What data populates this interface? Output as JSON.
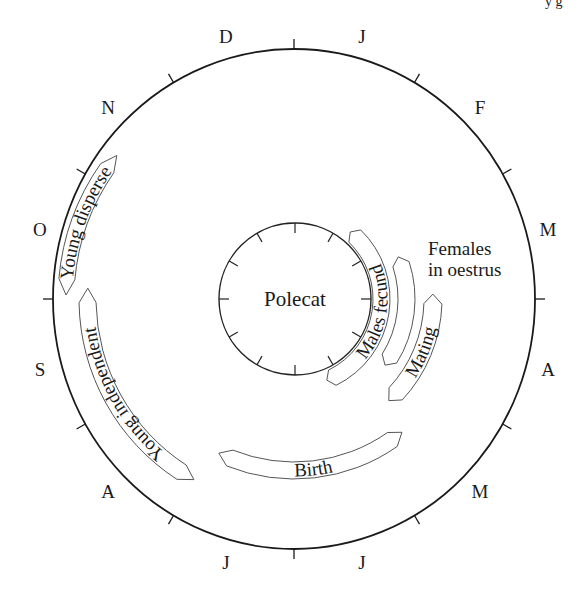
{
  "title": "Polecat",
  "page_fragment": "y g",
  "months": [
    {
      "label": "J",
      "angle": 15
    },
    {
      "label": "F",
      "angle": 45
    },
    {
      "label": "M",
      "angle": 75
    },
    {
      "label": "A",
      "angle": 105
    },
    {
      "label": "M",
      "angle": 135
    },
    {
      "label": "J",
      "angle": 165
    },
    {
      "label": "J",
      "angle": 195
    },
    {
      "label": "A",
      "angle": 225
    },
    {
      "label": "S",
      "angle": 255
    },
    {
      "label": "O",
      "angle": 285
    },
    {
      "label": "N",
      "angle": 315
    },
    {
      "label": "D",
      "angle": 345
    }
  ],
  "bands": [
    {
      "id": "males-fecund",
      "label": "Males fecund",
      "start": 40,
      "end": 158,
      "r_in": 79,
      "r_out": 96,
      "text_dir": "cw_inward"
    },
    {
      "id": "females-oestrus",
      "label": "",
      "start": 68,
      "end": 126,
      "r_in": 104,
      "r_out": 121
    },
    {
      "id": "mating",
      "label": "Mating",
      "start": 88,
      "end": 137,
      "r_in": 130,
      "r_out": 148
    },
    {
      "id": "birth",
      "label": "Birth",
      "start": 141,
      "end": 206,
      "r_in": 163,
      "r_out": 180
    },
    {
      "id": "young-independent",
      "label": "Young independent",
      "start": 209,
      "end": 273,
      "r_in": 198,
      "r_out": 215
    },
    {
      "id": "young-disperse",
      "label": "Young disperse",
      "start": 271,
      "end": 309,
      "r_in": 220,
      "r_out": 236
    }
  ],
  "free_labels": {
    "females_line1": "Females",
    "females_line2": "in oestrus"
  },
  "colors": {
    "outer_stroke": "#1a1a1a",
    "band_stroke": "#555555"
  }
}
